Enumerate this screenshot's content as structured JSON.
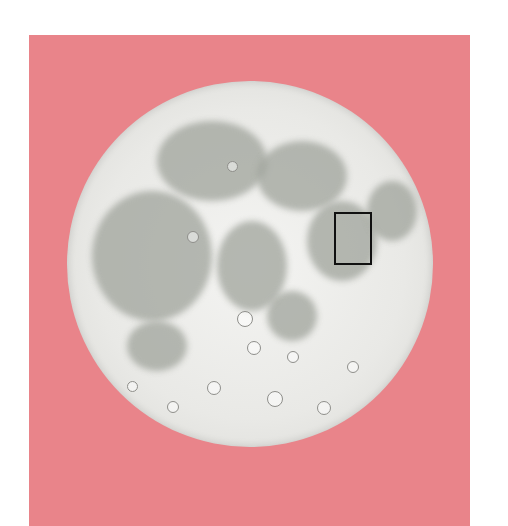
{
  "image": {
    "subject": "moon illustration",
    "background_color": "#e9848a",
    "moon_color": "#ececea",
    "highlight_box_color": "#111111"
  }
}
